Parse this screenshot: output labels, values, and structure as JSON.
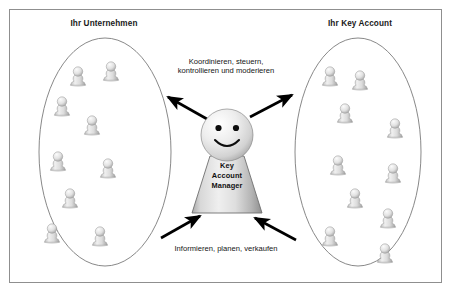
{
  "diagram": {
    "title_left": "Ihr Unternehmen",
    "title_right": "Ihr Key Account",
    "flow_top": "Koordinieren, steuern,\nkontrollieren und moderieren",
    "flow_top_line1": "Koordinieren, steuern,",
    "flow_top_line2": "kontrollieren und moderieren",
    "flow_bottom": "Informieren, planen, verkaufen",
    "center_role_line1": "Key",
    "center_role_line2": "Account",
    "center_role_line3": "Manager",
    "center_role_full": "Key Account Manager"
  },
  "colors": {
    "frame_border": "#8f8f8f",
    "ellipse_stroke": "#7a7a7a",
    "arrow_fill": "#000000",
    "text": "#1a1a1a",
    "pawn_light": "#f2f2f2",
    "pawn_mid": "#cfcfcf",
    "pawn_dark": "#9a9a9a",
    "background": "#ffffff"
  },
  "shapes": {
    "ellipse_left": {
      "cx": 105,
      "cy": 152,
      "rx": 66,
      "ry": 114
    },
    "ellipse_right": {
      "cx": 358,
      "cy": 152,
      "rx": 63,
      "ry": 114
    },
    "head": {
      "cx": 227,
      "cy": 135,
      "r": 26
    },
    "body": {
      "top_y": 155,
      "bottom_y": 213,
      "top_half_w": 17,
      "bottom_half_w": 35
    }
  },
  "pawns_left": [
    {
      "x": 78,
      "y": 68
    },
    {
      "x": 111,
      "y": 63
    },
    {
      "x": 62,
      "y": 98
    },
    {
      "x": 92,
      "y": 117
    },
    {
      "x": 58,
      "y": 153
    },
    {
      "x": 108,
      "y": 160
    },
    {
      "x": 70,
      "y": 190
    },
    {
      "x": 52,
      "y": 225
    },
    {
      "x": 100,
      "y": 228
    }
  ],
  "pawns_right": [
    {
      "x": 330,
      "y": 68
    },
    {
      "x": 360,
      "y": 72
    },
    {
      "x": 345,
      "y": 105
    },
    {
      "x": 395,
      "y": 120
    },
    {
      "x": 338,
      "y": 157
    },
    {
      "x": 393,
      "y": 165
    },
    {
      "x": 355,
      "y": 190
    },
    {
      "x": 388,
      "y": 210
    },
    {
      "x": 330,
      "y": 228
    },
    {
      "x": 385,
      "y": 245
    }
  ],
  "arrows": [
    {
      "name": "arrow-top-left",
      "direction": "outward-left",
      "x1": 205,
      "y1": 118,
      "x2": 165,
      "y2": 95
    },
    {
      "name": "arrow-top-right",
      "direction": "outward-right",
      "x1": 252,
      "y1": 116,
      "x2": 295,
      "y2": 93
    },
    {
      "name": "arrow-bottom-left",
      "direction": "inward-from-left",
      "x1": 160,
      "y1": 238,
      "x2": 203,
      "y2": 215
    },
    {
      "name": "arrow-bottom-right",
      "direction": "inward-from-right",
      "x1": 297,
      "y1": 240,
      "x2": 252,
      "y2": 217
    }
  ]
}
